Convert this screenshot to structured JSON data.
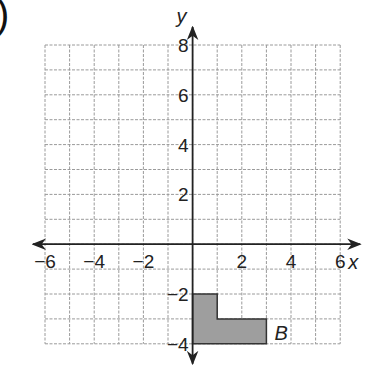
{
  "label_prefix": ")",
  "grid": {
    "x_min": -6,
    "x_max": 6,
    "y_min": -4,
    "y_max": 8,
    "origin_px": [
      192,
      244
    ],
    "cell_w": 24.6,
    "cell_h": 24.9,
    "left_px": 45,
    "top_px": 45,
    "line_color": "#9a9a9a",
    "axis_color": "#222222"
  },
  "axes": {
    "x_label": "x",
    "y_label": "y",
    "x_ticks": [
      {
        "value": -6,
        "label": "−6"
      },
      {
        "value": -4,
        "label": "−4"
      },
      {
        "value": -2,
        "label": "−2"
      },
      {
        "value": 2,
        "label": "2"
      },
      {
        "value": 4,
        "label": "4"
      },
      {
        "value": 6,
        "label": "6"
      }
    ],
    "y_ticks": [
      {
        "value": 8,
        "label": "8"
      },
      {
        "value": 6,
        "label": "6"
      },
      {
        "value": 4,
        "label": "4"
      },
      {
        "value": 2,
        "label": "2"
      },
      {
        "value": -2,
        "label": "−2"
      },
      {
        "value": -4,
        "label": "−4"
      }
    ]
  },
  "shape": {
    "label": "B",
    "fill": "#9e9e9e",
    "vertices": [
      [
        0,
        -2
      ],
      [
        1,
        -2
      ],
      [
        1,
        -3
      ],
      [
        3,
        -3
      ],
      [
        3,
        -4
      ],
      [
        0,
        -4
      ]
    ]
  }
}
